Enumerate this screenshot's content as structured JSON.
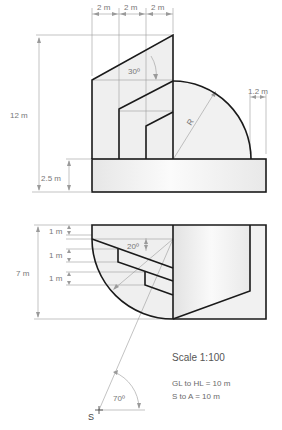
{
  "elevation": {
    "dimensions": {
      "top_widths": [
        "2 m",
        "2 m",
        "2 m"
      ],
      "total_height": "12 m",
      "base_height": "2.5 m",
      "offset_right": "1.2 m",
      "angle": "30º",
      "radius_label": "R"
    }
  },
  "plan": {
    "dimensions": {
      "total_depth": "7 m",
      "steps": [
        "1 m",
        "1 m",
        "1 m"
      ],
      "angle": "20º"
    },
    "station_point": {
      "label": "S",
      "angle": "70º"
    }
  },
  "notes": {
    "scale": "Scale 1:100",
    "gl_to_hl": "GL to HL = 10 m",
    "s_to_a": "S to A = 10 m"
  },
  "colors": {
    "outline": "#1a1a1a",
    "construction": "#9a9a9a",
    "fill": "#efefef",
    "text": "#777777"
  }
}
